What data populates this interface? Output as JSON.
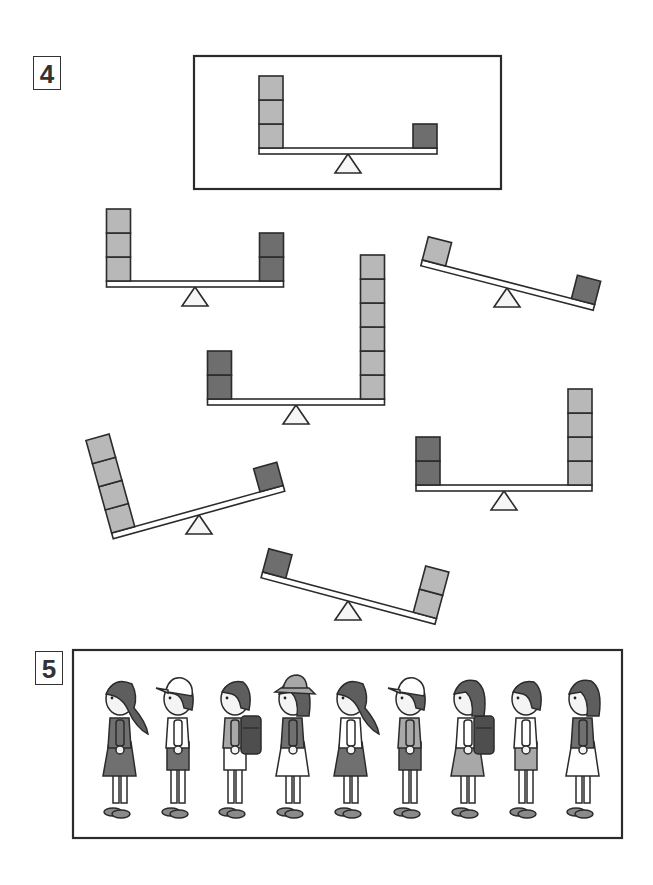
{
  "problem4": {
    "number_label": "4",
    "colors": {
      "light": "#b8b8b8",
      "dark": "#6e6e6e",
      "stroke": "#2b2b2b",
      "beam_fill": "#ffffff",
      "fulcrum_fill": "#f6f6f6"
    },
    "reference": {
      "left": {
        "weight": "light",
        "count": 3
      },
      "right": {
        "weight": "dark",
        "count": 1
      },
      "tilt": "level"
    },
    "seesaws": [
      {
        "id": "A",
        "left": {
          "weight": "light",
          "count": 3
        },
        "right": {
          "weight": "dark",
          "count": 2
        },
        "tilt": "level"
      },
      {
        "id": "B",
        "left": {
          "weight": "light",
          "count": 1
        },
        "right": {
          "weight": "dark",
          "count": 1
        },
        "tilt": "right-down"
      },
      {
        "id": "C",
        "left": {
          "weight": "dark",
          "count": 2
        },
        "right": {
          "weight": "light",
          "count": 6
        },
        "tilt": "level"
      },
      {
        "id": "D",
        "left": {
          "weight": "light",
          "count": 4
        },
        "right": {
          "weight": "dark",
          "count": 1
        },
        "tilt": "left-down"
      },
      {
        "id": "E",
        "left": {
          "weight": "dark",
          "count": 2
        },
        "right": {
          "weight": "light",
          "count": 4
        },
        "tilt": "level"
      },
      {
        "id": "F",
        "left": {
          "weight": "dark",
          "count": 1
        },
        "right": {
          "weight": "light",
          "count": 2
        },
        "tilt": "right-down"
      }
    ]
  },
  "problem5": {
    "number_label": "5",
    "children": [
      {
        "type": "girl-ponytail",
        "headwear": "none",
        "top": "dark-jumper",
        "bottom": "dark-skirt",
        "bag": "none"
      },
      {
        "type": "boy",
        "headwear": "white-cap",
        "top": "white-shirt",
        "bottom": "dark-shorts",
        "bag": "none"
      },
      {
        "type": "boy",
        "headwear": "none",
        "top": "gray-shirt",
        "bottom": "white-shorts",
        "bag": "randoseru"
      },
      {
        "type": "girl",
        "headwear": "bucket-hat",
        "top": "dark-shirt",
        "bottom": "white-skirt",
        "bag": "none"
      },
      {
        "type": "girl-ponytail",
        "headwear": "none",
        "top": "white-shirt",
        "bottom": "dark-skirt",
        "bag": "none"
      },
      {
        "type": "boy",
        "headwear": "white-cap",
        "top": "gray-shirt",
        "bottom": "dark-shorts",
        "bag": "none"
      },
      {
        "type": "girl-bob",
        "headwear": "none",
        "top": "white-shirt",
        "bottom": "gray-skirt",
        "bag": "randoseru"
      },
      {
        "type": "boy",
        "headwear": "none",
        "top": "white-shirt",
        "bottom": "gray-shorts",
        "bag": "none"
      },
      {
        "type": "girl-bob",
        "headwear": "none",
        "top": "dark-shirt",
        "bottom": "white-skirt",
        "bag": "none"
      }
    ]
  }
}
